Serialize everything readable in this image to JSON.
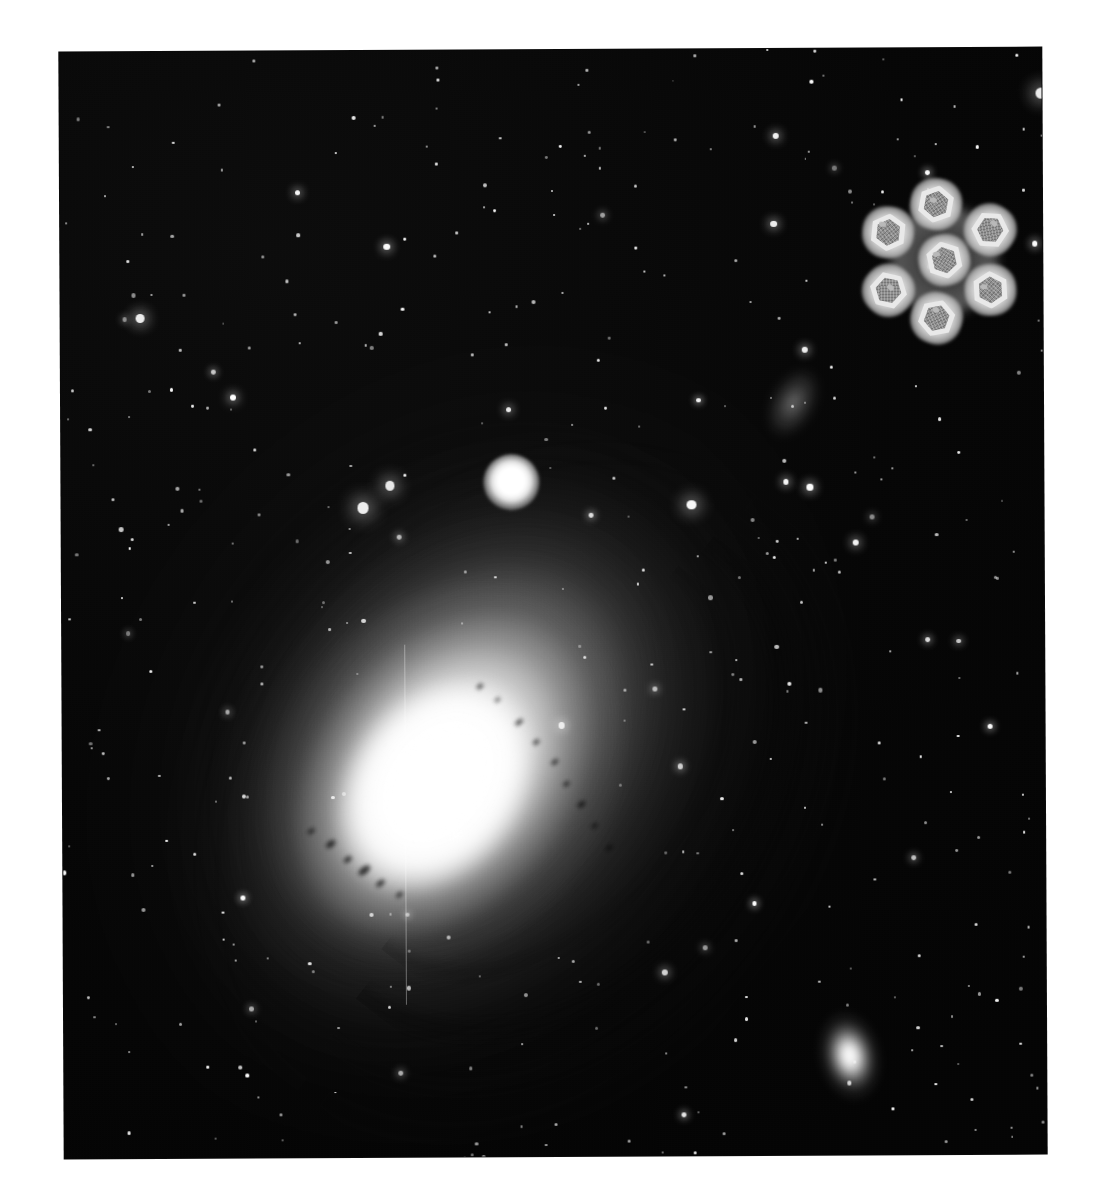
{
  "page": {
    "background_color": "#ffffff",
    "width": 1100,
    "height": 1200
  },
  "plate": {
    "name": "astronomical-photographic-plate",
    "x": 62,
    "y": 50,
    "width": 982,
    "height": 1106,
    "rotation_deg": -0.28,
    "background_color": "#050505",
    "medium": "grayscale photographic plate",
    "grain": true
  },
  "galaxy": {
    "name": "andromeda-galaxy",
    "common_name": "Andromeda Galaxy",
    "catalog": "M31",
    "type": "spiral galaxy",
    "inclination": "highly inclined / near edge-on",
    "disk_position_angle_deg": 38,
    "core_color": "#ffffff",
    "halo_color": "#9a9a9a",
    "dust_lane_color": "#080808",
    "dust_lane_count": 5,
    "center": {
      "x": 380,
      "y": 740
    },
    "bulge": {
      "width": 330,
      "height": 400
    }
  },
  "companions": [
    {
      "name": "companion-galaxy-m32",
      "label": "M32",
      "type": "compact elliptical",
      "center": {
        "x": 456,
        "y": 438
      },
      "radius": 28,
      "color": "#ffffff"
    },
    {
      "name": "companion-galaxy-ngc205",
      "label": "NGC 205",
      "type": "dwarf elliptical",
      "center": {
        "x": 791,
        "y": 1011
      },
      "width": 78,
      "height": 118,
      "rotation_deg": -12,
      "color": "#f0f0f0"
    }
  ],
  "star_cloud": {
    "name": "star-cloud-patch",
    "label": "NGC 206",
    "center": {
      "x": 738,
      "y": 360
    },
    "color": "#bebebe"
  },
  "micrograph": {
    "name": "electron-micrograph-overlay",
    "description": "negative-stain electron micrograph of a hexagonal protein complex",
    "subunit_count": 7,
    "arrangement": "hexagonal close packing: 1 central subunit surrounded by 6",
    "symmetry": "six-fold",
    "center": {
      "x": 890,
      "y": 218
    },
    "overall_diameter": 168,
    "subunit_diameter": 52,
    "halo_color": "#e9e9e9",
    "core_color": "#8f8f8f",
    "ring_color": "#e9e9e9",
    "subunits": [
      {
        "label": "center",
        "dx": 0,
        "dy": 0
      },
      {
        "label": "top",
        "dx": -8,
        "dy": -56
      },
      {
        "label": "upper-right",
        "dx": 46,
        "dy": -30
      },
      {
        "label": "lower-right",
        "dx": 46,
        "dy": 30
      },
      {
        "label": "bottom",
        "dx": -8,
        "dy": 58
      },
      {
        "label": "lower-left",
        "dx": -56,
        "dy": 30
      },
      {
        "label": "upper-left",
        "dx": -56,
        "dy": -28
      }
    ]
  },
  "starfield": {
    "name": "starfield",
    "star_count": 430,
    "star_color": "#ffffff",
    "background_color": "#050505",
    "density": "dense"
  },
  "palette": {
    "page_background": "#ffffff",
    "sky": "#050505",
    "star": "#ffffff",
    "galaxy_core": "#ffffff",
    "galaxy_halo": "#9a9a9a",
    "dust_lane": "#080808",
    "micrograph_halo": "#e9e9e9",
    "micrograph_core": "#8f8f8f"
  }
}
